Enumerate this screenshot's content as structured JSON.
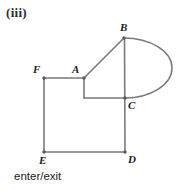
{
  "figure": {
    "part_label": "(iii)",
    "caption": "enter/exit",
    "stroke_color": "#7a7a7a",
    "label_color": "#1c1c1c",
    "background_color": "#ffffff",
    "canvas": {
      "width": 188,
      "height": 190
    },
    "vertices": [
      {
        "id": "A",
        "label": "A",
        "x": 84,
        "y": 78,
        "label_x": 72,
        "label_y": 65
      },
      {
        "id": "B",
        "label": "B",
        "x": 124,
        "y": 38,
        "label_x": 120,
        "label_y": 22
      },
      {
        "id": "C",
        "label": "C",
        "x": 125,
        "y": 98,
        "label_x": 128,
        "label_y": 100
      },
      {
        "id": "D",
        "label": "D",
        "x": 125,
        "y": 152,
        "label_x": 128,
        "label_y": 154
      },
      {
        "id": "E",
        "label": "E",
        "x": 44,
        "y": 152,
        "label_x": 38,
        "label_y": 155
      },
      {
        "id": "F",
        "label": "F",
        "x": 44,
        "y": 78,
        "label_x": 33,
        "label_y": 64
      }
    ],
    "edges": [
      {
        "id": "FA",
        "from": "F",
        "to": "A",
        "kind": "line"
      },
      {
        "id": "AB",
        "from": "A",
        "to": "B",
        "kind": "line"
      },
      {
        "id": "BD",
        "from": "B",
        "to": "D",
        "kind": "line"
      },
      {
        "id": "A-notch-down",
        "from": "A",
        "to": "notch",
        "kind": "line"
      },
      {
        "id": "notch-C",
        "from": "notch",
        "to": "C",
        "kind": "line"
      },
      {
        "id": "FE",
        "from": "F",
        "to": "E",
        "kind": "line"
      },
      {
        "id": "ED",
        "from": "E",
        "to": "D",
        "kind": "line"
      },
      {
        "id": "BC-arc",
        "from": "B",
        "to": "C",
        "kind": "arc",
        "bulge": "right",
        "extent_x": 172
      }
    ],
    "notch_point": {
      "x": 84,
      "y": 98
    }
  }
}
